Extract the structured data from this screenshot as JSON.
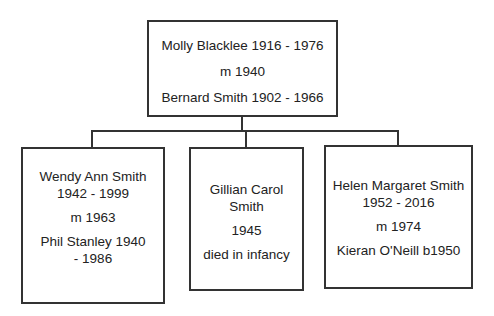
{
  "parents": {
    "line1": "Molly Blacklee 1916 - 1976",
    "line2": "m 1940",
    "line3": "Bernard Smith 1902 - 1966"
  },
  "children": [
    {
      "name": "Wendy Ann Smith",
      "dates": "1942 - 1999",
      "marriage": "m 1963",
      "spouse": "Phil Stanley 1940 - 1986"
    },
    {
      "name": "Gillian Carol Smith",
      "dates": "1945",
      "note": "died in infancy"
    },
    {
      "name": "Helen Margaret Smith",
      "dates": "1952 - 2016",
      "marriage": "m 1974",
      "spouse": "Kieran O'Neill b1950"
    }
  ]
}
